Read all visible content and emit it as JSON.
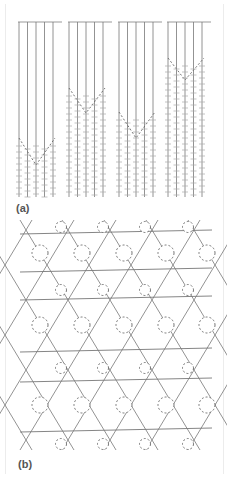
{
  "figure": {
    "panels": [
      {
        "label": "(a)",
        "description": "Four groups of five vertical lines hanging from a common horizontal line, each ending in a V-shaped dashed boundary with cross-hatched region below",
        "groups": 4,
        "lines_per_group": 5
      },
      {
        "label": "(b)",
        "description": "Kagome-like lattice of crossing diagonal and horizontal lines with dashed circles at intersection nodes"
      }
    ]
  }
}
